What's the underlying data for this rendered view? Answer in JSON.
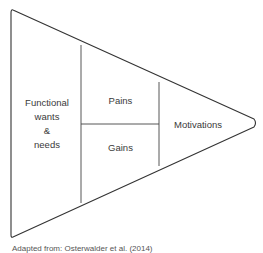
{
  "diagram": {
    "type": "triangle-segmented",
    "regions": {
      "left": {
        "label_lines": [
          "Functional",
          "wants",
          "&",
          "needs"
        ]
      },
      "upper_middle": {
        "label": "Pains"
      },
      "lower_middle": {
        "label": "Gains"
      },
      "right": {
        "label": "Motivations"
      }
    },
    "caption": "Adapted from: Osterwalder et al. (2014)",
    "colors": {
      "stroke": "#333333",
      "text": "#3a3a3a",
      "background": "#ffffff"
    }
  }
}
